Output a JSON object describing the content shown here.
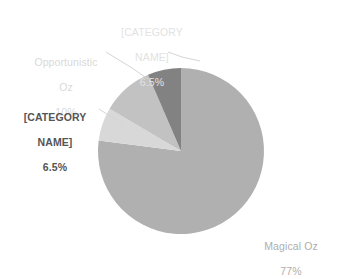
{
  "chart_data": {
    "type": "pie",
    "title": "",
    "subtitle": "",
    "xlabel": "",
    "ylabel": "",
    "legend_position": "none",
    "grid": false,
    "labels_inside": false,
    "start_angle_deg": 0,
    "direction": "clockwise",
    "categories": [
      "Magical Oz",
      "[CATEGORY NAME]",
      "Opportunistic Oz",
      "[CATEGORY NAME]"
    ],
    "values": [
      77,
      6.5,
      10,
      6.5
    ],
    "value_unit": "%",
    "slices": [
      {
        "name": "Magical Oz",
        "value": 77,
        "percent_label": "77%",
        "color": "#b0b0b0",
        "label_color": "#aeaeae",
        "leader_line": false
      },
      {
        "name": "[CATEGORY NAME]",
        "value": 6.5,
        "percent_label": "6.5%",
        "color": "#d8d8d8",
        "label_color": "#e2e2e2",
        "leader_line": true
      },
      {
        "name": "Opportunistic Oz",
        "value": 10,
        "percent_label": "10%",
        "color": "#c2c2c2",
        "label_color": "#d9d9d9",
        "leader_line": true
      },
      {
        "name": "[CATEGORY NAME]",
        "value": 6.5,
        "percent_label": "6.5%",
        "color": "#828282",
        "label_color": "#555555",
        "leader_line": true
      }
    ]
  },
  "labels": {
    "magical_oz": {
      "name": "Magical Oz",
      "percent": "77%"
    },
    "opportunistic_oz": {
      "name_line1": "Opportunistic",
      "name_line2": "Oz",
      "percent": "10%"
    },
    "category_left": {
      "name_line1": "[CATEGORY",
      "name_line2": "NAME]",
      "percent": "6.5%"
    },
    "category_top": {
      "name_line1": "[CATEGORY",
      "name_line2": "NAME]",
      "percent": "6.5%"
    }
  },
  "colors": {
    "slice_magical_oz": "#b0b0b0",
    "slice_category_top": "#d8d8d8",
    "slice_opportunistic_oz": "#c2c2c2",
    "slice_category_left": "#828282",
    "leader_line": "#d5d5d5",
    "background": "#ffffff"
  }
}
